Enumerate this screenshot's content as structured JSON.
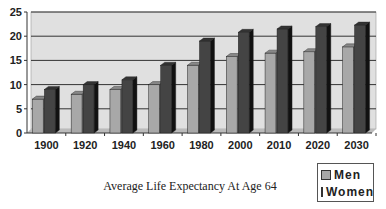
{
  "chart_data": {
    "type": "bar",
    "title": "Average Life Expectancy At Age 64",
    "xlabel": "",
    "ylabel": "",
    "ylim": [
      0,
      25
    ],
    "yticks": [
      0,
      5,
      10,
      15,
      20,
      25
    ],
    "grid": true,
    "legend_position": "bottom-right",
    "categories": [
      "1900",
      "1920",
      "1940",
      "1960",
      "1980",
      "2000",
      "2010",
      "2020",
      "2030"
    ],
    "series": [
      {
        "name": "Men",
        "color": "#a8a8a8",
        "values": [
          7,
          8,
          9,
          10,
          14,
          15.8,
          16.5,
          16.8,
          17.8
        ]
      },
      {
        "name": "Women",
        "color": "#444444",
        "values": [
          9,
          10,
          11,
          14,
          19,
          20.8,
          21.5,
          22,
          22.3
        ]
      }
    ]
  },
  "legend": {
    "men": "Men",
    "women": "Women"
  }
}
